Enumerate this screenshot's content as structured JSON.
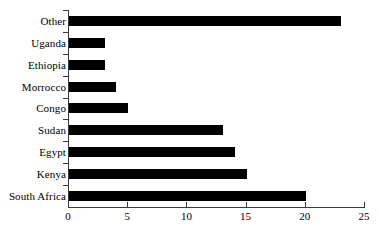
{
  "chart_data": {
    "type": "bar",
    "orientation": "horizontal",
    "title": "",
    "subtitle": "",
    "xlabel": "",
    "ylabel": "",
    "categories": [
      "Other",
      "Uganda",
      "Ethiopia",
      "Morrocco",
      "Congo",
      "Sudan",
      "Egypt",
      "Kenya",
      "South Africa"
    ],
    "values": [
      23,
      3,
      3,
      4,
      5,
      13,
      14,
      15,
      20
    ],
    "xlim": [
      0,
      25
    ],
    "xticks": [
      0,
      5,
      10,
      15,
      20,
      25
    ],
    "xticklabels": [
      "0",
      "5",
      "10",
      "15",
      "20",
      "25"
    ],
    "grid": false,
    "legend": false,
    "bar_color": "#000000",
    "axis_color": "#3a3a3a",
    "background_color": "#ffffff"
  }
}
